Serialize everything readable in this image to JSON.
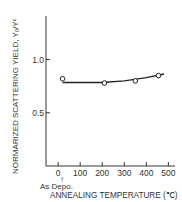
{
  "chart_data": {
    "type": "scatter",
    "title": "",
    "xlabel": "ANNEALING TEMPERATURE (℃)",
    "ylabel": "NORMARIZED SCATTERING YIELD, Y₀/Yᶜ",
    "xlim": [
      -55,
      530
    ],
    "ylim": [
      0,
      1.41
    ],
    "x_ticks": [
      0,
      100,
      200,
      300,
      400,
      500
    ],
    "x_tick_labels": [
      "0",
      "100",
      "200",
      "300",
      "400",
      "500"
    ],
    "y_ticks": [
      0.5,
      1.0
    ],
    "y_tick_labels": [
      "0.5",
      "1.0"
    ],
    "annotation": "As Depo.",
    "grid": false,
    "series": [
      {
        "name": "measured",
        "marker": "open-circle",
        "x": [
          20,
          210,
          350,
          455
        ],
        "y": [
          0.82,
          0.78,
          0.8,
          0.85
        ]
      },
      {
        "name": "fit-curve",
        "marker": "line",
        "x": [
          20,
          100,
          200,
          300,
          400,
          480
        ],
        "y": [
          0.785,
          0.785,
          0.785,
          0.8,
          0.83,
          0.865
        ]
      }
    ]
  }
}
